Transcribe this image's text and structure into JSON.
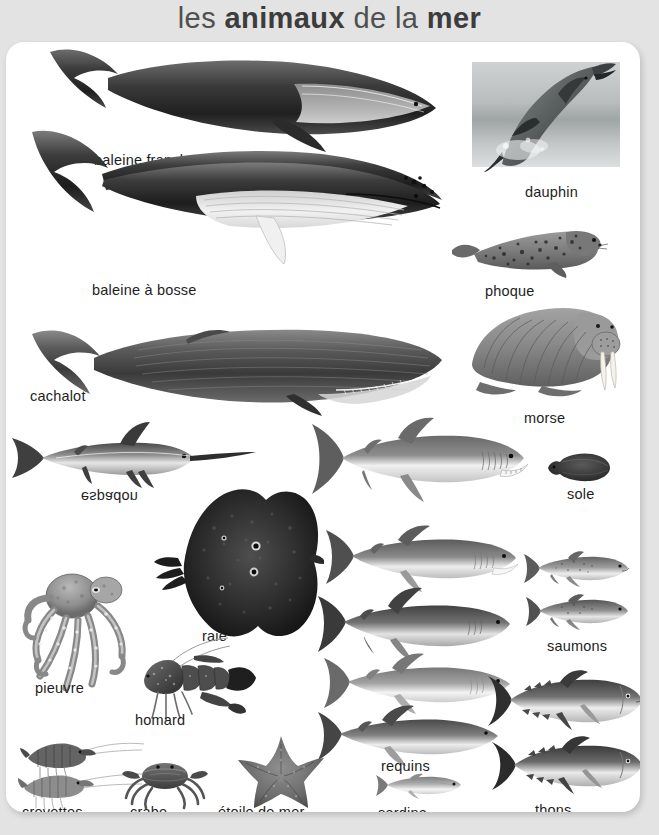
{
  "title": {
    "part1": "les ",
    "part2": "animaux",
    "part3": " de la ",
    "part4": "mer"
  },
  "colors": {
    "background": "#e3e3e3",
    "card": "#ffffff",
    "title_text": "#4f4f4f",
    "title_bold": "#3c3c3c",
    "label_text": "#1e1e1e"
  },
  "animals": [
    {
      "label": "baleine franche",
      "name": "right-whale"
    },
    {
      "label": "dauphin",
      "name": "dolphin"
    },
    {
      "label": "baleine à bosse",
      "name": "humpback-whale"
    },
    {
      "label": "phoque",
      "name": "seal"
    },
    {
      "label": "cachalot",
      "name": "sperm-whale"
    },
    {
      "label": "morse",
      "name": "walrus"
    },
    {
      "label": "espadon",
      "name": "swordfish"
    },
    {
      "label": "sole",
      "name": "sole"
    },
    {
      "label": "raie",
      "name": "ray"
    },
    {
      "label": "pieuvre",
      "name": "octopus"
    },
    {
      "label": "homard",
      "name": "lobster"
    },
    {
      "label": "saumons",
      "name": "salmon"
    },
    {
      "label": "requins",
      "name": "sharks"
    },
    {
      "label": "crevettes",
      "name": "shrimp"
    },
    {
      "label": "crabe",
      "name": "crab"
    },
    {
      "label": "étoile de mer",
      "name": "starfish"
    },
    {
      "label": "sardine",
      "name": "sardine"
    },
    {
      "label": "thons",
      "name": "tuna"
    }
  ]
}
